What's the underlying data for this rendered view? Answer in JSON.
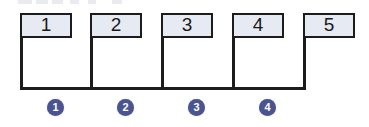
{
  "diagram": {
    "type": "interval-timeline",
    "colors": {
      "box_fill": "#e6eaf2",
      "box_border": "#1c1c1c",
      "line": "#1c1c1c",
      "marker_fill": "#4a5490",
      "marker_text": "#ffffff",
      "background": "#ffffff"
    },
    "nodes": [
      {
        "id": "node-1",
        "label": "1",
        "x": 20,
        "y": 13,
        "width": 52,
        "height": 25
      },
      {
        "id": "node-2",
        "label": "2",
        "x": 90,
        "y": 13,
        "width": 52,
        "height": 25
      },
      {
        "id": "node-3",
        "label": "3",
        "x": 161,
        "y": 13,
        "width": 52,
        "height": 25
      },
      {
        "id": "node-4",
        "label": "4",
        "x": 232,
        "y": 13,
        "width": 52,
        "height": 25
      },
      {
        "id": "node-5",
        "label": "5",
        "x": 303,
        "y": 13,
        "width": 52,
        "height": 25
      }
    ],
    "drop_lines": [
      {
        "id": "drop-1",
        "x": 20,
        "top": 13,
        "bottom": 90
      },
      {
        "id": "drop-2",
        "x": 90,
        "top": 13,
        "bottom": 90
      },
      {
        "id": "drop-3",
        "x": 161,
        "top": 13,
        "bottom": 90
      },
      {
        "id": "drop-4",
        "x": 232,
        "top": 13,
        "bottom": 90
      },
      {
        "id": "drop-5",
        "x": 303,
        "top": 13,
        "bottom": 90
      }
    ],
    "baseline": {
      "x": 20,
      "y": 87,
      "width": 286
    },
    "markers": [
      {
        "id": "marker-1",
        "label": "1",
        "x": 47,
        "y": 99
      },
      {
        "id": "marker-2",
        "label": "2",
        "x": 117,
        "y": 99
      },
      {
        "id": "marker-3",
        "label": "3",
        "x": 188,
        "y": 99
      },
      {
        "id": "marker-4",
        "label": "4",
        "x": 259,
        "y": 99
      }
    ],
    "top_artifacts": [
      {
        "x": 18,
        "width": 14
      },
      {
        "x": 36,
        "width": 12
      },
      {
        "x": 52,
        "width": 11
      },
      {
        "x": 70,
        "width": 9
      },
      {
        "x": 88,
        "width": 8
      },
      {
        "x": 112,
        "width": 10
      }
    ]
  }
}
